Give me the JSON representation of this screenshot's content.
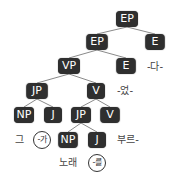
{
  "diagram": {
    "type": "syntax-tree",
    "nodes": {
      "ep_root": "EP",
      "ep_2": "EP",
      "e_2": "E",
      "vp": "VP",
      "e_3": "E",
      "jp_1": "JP",
      "v_1": "V",
      "np_1": "NP",
      "j_1": "J",
      "jp_2": "JP",
      "v_2": "V",
      "np_2": "NP",
      "j_2": "J"
    },
    "leaves": {
      "da": "-다-",
      "eoss": "-었-",
      "geu": "그",
      "ga": "-가",
      "bureu": "부르-",
      "norae": "노래",
      "reul": "-를"
    },
    "colors": {
      "node_bg": "#2f2f2f",
      "node_text": "#ffffff",
      "edge": "#888888",
      "leaf_text": "#444444"
    }
  }
}
